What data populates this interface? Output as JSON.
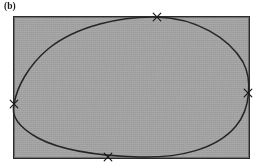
{
  "figure": {
    "panel_label": "(b)",
    "caption_text": "",
    "colors": {
      "background": "#ffffff",
      "region_fill": "#a8a8a8",
      "rect_border": "#2b2b2b",
      "curve_stroke": "#262626",
      "marker": "#1a1a1a",
      "label_text": "#1c1c1c"
    },
    "bounding_rect": {
      "x": 14,
      "y": 17,
      "width": 235,
      "height": 141,
      "border_width": 1.4,
      "fill_label": "shaded-region"
    },
    "curve": {
      "name": "closed-convex-curve",
      "shape": "egg",
      "stroke_width": 1.5,
      "closed": true,
      "path": "M 157 17 C 196 18 229 38 243 62 C 252 79 251 108 236 126 C 216 150 178 158 140 157 C 104 156 64 152 38 138 C 18 127 11 115 14 104 C 17 87 28 66 48 49 C 76 26 122 16 157 17 Z"
    },
    "tangent_markers": [
      {
        "id": "top-tangent-marker",
        "label": "x",
        "x": 157,
        "y": 17,
        "side": "top"
      },
      {
        "id": "right-tangent-marker",
        "label": "x",
        "x": 248,
        "y": 93,
        "side": "right"
      },
      {
        "id": "bottom-tangent-marker",
        "label": "x",
        "x": 108,
        "y": 157,
        "side": "bottom"
      },
      {
        "id": "left-tangent-marker",
        "label": "x",
        "x": 14,
        "y": 104,
        "side": "left"
      }
    ]
  }
}
